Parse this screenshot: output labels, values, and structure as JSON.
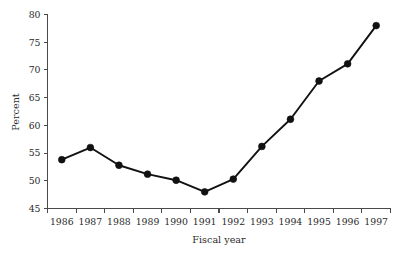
{
  "chart_data": {
    "type": "line",
    "title": "",
    "subtitle": "",
    "xlabel": "Fiscal year",
    "ylabel": "Percent",
    "categories": [
      "1986",
      "1987",
      "1988",
      "1989",
      "1990",
      "1991",
      "1992",
      "1993",
      "1994",
      "1995",
      "1996",
      "1997"
    ],
    "values": [
      53.8,
      56.0,
      52.8,
      51.2,
      50.1,
      48.0,
      50.3,
      56.2,
      61.1,
      68.0,
      71.1,
      78.0
    ],
    "series": [
      {
        "name": "Percent",
        "values": [
          53.8,
          56.0,
          52.8,
          51.2,
          50.1,
          48.0,
          50.3,
          56.2,
          61.1,
          68.0,
          71.1,
          78.0
        ]
      }
    ],
    "ylim": [
      45,
      80
    ],
    "yticks": [
      45,
      50,
      55,
      60,
      65,
      70,
      75,
      80
    ],
    "yticklabels": [
      "45",
      "50",
      "55",
      "60",
      "65",
      "70",
      "75",
      "80"
    ],
    "xticklabels": [
      "1986",
      "1987",
      "1988",
      "1989",
      "1990",
      "1991",
      "1992",
      "1993",
      "1994",
      "1995",
      "1996",
      "1997"
    ],
    "grid": false,
    "legend": false,
    "legend_position": "none",
    "marker": "filled-circle",
    "line_color": "#111111",
    "marker_color": "#111111",
    "axis_color": "#4a4a4a",
    "background_color": "#ffffff"
  },
  "axes": {
    "y_title": "Percent",
    "x_title": "Fiscal year"
  }
}
